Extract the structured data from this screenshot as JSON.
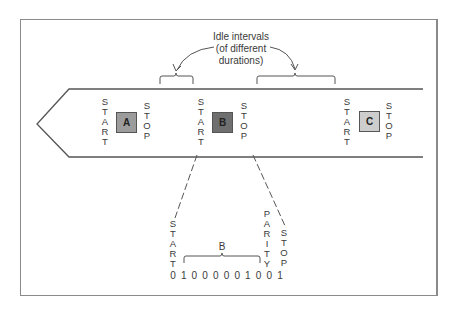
{
  "caption": {
    "line1": "Idle intervals",
    "line2": "(of different",
    "line3": "durations)"
  },
  "characters": [
    {
      "label": "A",
      "start": "START",
      "stop": "STOP",
      "color": "#9c9c9c"
    },
    {
      "label": "B",
      "start": "START",
      "stop": "STOP",
      "color": "#6f6f6f"
    },
    {
      "label": "C",
      "start": "START",
      "stop": "STOP",
      "color": "#cdcdcd"
    }
  ],
  "expansion": {
    "start_label": "START",
    "data_label": "B",
    "parity_label": "PARITY",
    "stop_label": "STOP",
    "bits": [
      "0",
      "1",
      "0",
      "0",
      "0",
      "0",
      "0",
      "1",
      "0",
      "0",
      "1"
    ]
  }
}
